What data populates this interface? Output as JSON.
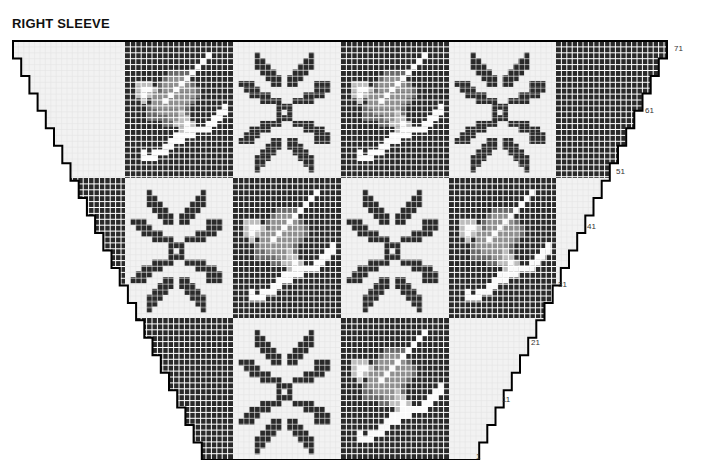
{
  "title": "RIGHT SLEEVE",
  "colors": {
    "dark": "#2a2a2a",
    "light": "#f2f2f2",
    "grid_on_dark": "#ffffff",
    "grid_on_light": "#e4e4e4",
    "outline": "#000000",
    "gray_light": "#bdbdbd",
    "gray_mid": "#8f8f8f",
    "gray_dark": "#6a6a6a",
    "white": "#fafafa"
  },
  "row_labels": [
    {
      "label": "71",
      "x": 674,
      "y": 50
    },
    {
      "label": "61",
      "x": 645,
      "y": 112
    },
    {
      "label": "51",
      "x": 616,
      "y": 173
    },
    {
      "label": "41",
      "x": 587,
      "y": 228
    },
    {
      "label": "31",
      "x": 558,
      "y": 286
    },
    {
      "label": "21",
      "x": 531,
      "y": 344
    },
    {
      "label": "11",
      "x": 502,
      "y": 401
    },
    {
      "label": "1",
      "x": 476,
      "y": 458
    }
  ],
  "chart_layout": {
    "top_y": 41,
    "bottom_y": 460,
    "top_left_x": 13,
    "top_right_x": 667,
    "bottom_left_x": 210,
    "bottom_right_x": 471,
    "columns_x": [
      13,
      125,
      233,
      341,
      449,
      556,
      667
    ],
    "rows_y": [
      41,
      178,
      318,
      460
    ],
    "stitch_w": 5.4,
    "stitch_h": 5.9
  },
  "blocks": [
    [
      "light",
      "dark:skier",
      "light:snowflake",
      "dark:skier",
      "light:snowflake",
      "dark"
    ],
    [
      "dark",
      "light:snowflake",
      "dark:skier",
      "light:snowflake",
      "dark:skier",
      "light"
    ],
    [
      "light",
      "dark",
      "light:snowflake",
      "dark:skier",
      "light",
      "dark"
    ]
  ],
  "motifs": {
    "snowflake": [
      "....................",
      "....................",
      "....X.........X.....",
      "....XX.......XX.....",
      "....XXX.....XXX.....",
      ".....XXX...XXX......",
      "......XXX.XXX.......",
      ".XXX...XX.XX...XXX..",
      "..XXX..........XXX..",
      "...XXXX......XXXX...",
      ".....XXXX..XXXX.....",
      "........XXX.........",
      "........X.X.........",
      "........XXX.........",
      ".....XXXX..XXXX.....",
      "...XXXX......XXXX...",
      "..XXX..........XXX..",
      ".XXX...XX.XX...XXX..",
      "......XXX.XXX.......",
      ".....XXX...XXX......",
      "....XXX.....XXX.....",
      "....XX.......XX.....",
      "....X.........X.....",
      "...................."
    ],
    "skier": [
      "....................",
      "....................",
      "...............W....",
      "..............W.....",
      ".............W......",
      "........GGGGW.......",
      ".......GMMMW........",
      "..LLL.GMMMWMG.......",
      "..LWWLGMMWMMMG......",
      "..LWLMMMWMMMMG......",
      "...L.MMWMMMMG.......",
      "....DMMMMMMG......W.",
      "....DDMMMMLG.....WW.",
      "....DDDDMMLL....WW..",
      ".......DDLLWL..WW...",
      "..........LWWWWW....",
      ".........WWWW.......",
      "........WWW.........",
      ".......WW...........",
      "...W.WWW............",
      "...WWW..............",
      "....................",
      "....................",
      "...................."
    ]
  }
}
